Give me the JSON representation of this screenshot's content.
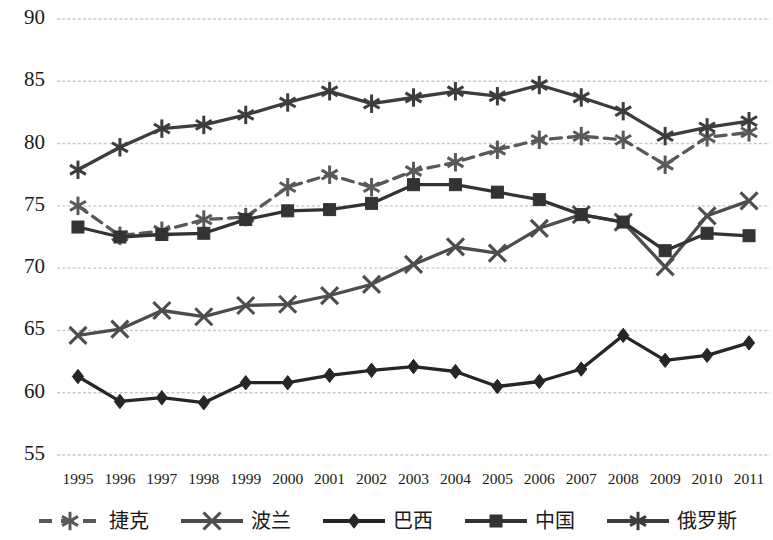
{
  "chart_data": {
    "type": "line",
    "title": "",
    "xlabel": "",
    "ylabel": "",
    "ylim": [
      55,
      90
    ],
    "ytick_step": 5,
    "grid": true,
    "legend_position": "bottom",
    "categories": [
      "1995",
      "1996",
      "1997",
      "1998",
      "1999",
      "2000",
      "2001",
      "2002",
      "2003",
      "2004",
      "2005",
      "2006",
      "2007",
      "2008",
      "2009",
      "2010",
      "2011"
    ],
    "yticks": [
      "90",
      "85",
      "80",
      "75",
      "70",
      "65",
      "60",
      "55"
    ],
    "series": [
      {
        "name": "捷克",
        "marker": "asterisk",
        "line_style": "dashed",
        "color": "#595959",
        "values": [
          75.0,
          72.6,
          73.0,
          73.9,
          74.1,
          76.5,
          77.5,
          76.5,
          77.8,
          78.5,
          79.5,
          80.3,
          80.6,
          80.3,
          78.3,
          80.5,
          80.9
        ]
      },
      {
        "name": "波兰",
        "marker": "x",
        "line_style": "solid",
        "color": "#4d4d4d",
        "values": [
          64.6,
          65.1,
          66.6,
          66.1,
          67.0,
          67.1,
          67.8,
          68.7,
          70.3,
          71.7,
          71.2,
          73.2,
          74.3,
          73.7,
          70.1,
          74.2,
          75.4
        ]
      },
      {
        "name": "巴西",
        "marker": "diamond",
        "line_style": "solid",
        "color": "#262626",
        "values": [
          61.3,
          59.3,
          59.6,
          59.2,
          60.8,
          60.8,
          61.4,
          61.8,
          62.1,
          61.7,
          60.5,
          60.9,
          61.9,
          64.6,
          62.6,
          63.0,
          64.0
        ]
      },
      {
        "name": "中国",
        "marker": "square",
        "line_style": "solid",
        "color": "#333333",
        "values": [
          73.3,
          72.5,
          72.7,
          72.8,
          73.9,
          74.6,
          74.7,
          75.2,
          76.7,
          76.7,
          76.1,
          75.5,
          74.3,
          73.7,
          71.4,
          72.8,
          72.6
        ]
      },
      {
        "name": "俄罗斯",
        "marker": "asterisk",
        "line_style": "solid",
        "color": "#3d3d3d",
        "values": [
          77.9,
          79.7,
          81.2,
          81.5,
          82.3,
          83.3,
          84.2,
          83.2,
          83.7,
          84.2,
          83.8,
          84.7,
          83.7,
          82.6,
          80.6,
          81.3,
          81.8
        ]
      }
    ]
  },
  "legend": {
    "items": [
      {
        "label": "捷克",
        "marker": "asterisk",
        "line_style": "dashed"
      },
      {
        "label": "波兰",
        "marker": "x",
        "line_style": "solid"
      },
      {
        "label": "巴西",
        "marker": "diamond",
        "line_style": "solid"
      },
      {
        "label": "中国",
        "marker": "square",
        "line_style": "solid"
      },
      {
        "label": "俄罗斯",
        "marker": "asterisk",
        "line_style": "solid"
      }
    ]
  },
  "style": {
    "grid_color": "#c9c9c9",
    "text_color": "#1a1a1a",
    "background": "#ffffff"
  }
}
